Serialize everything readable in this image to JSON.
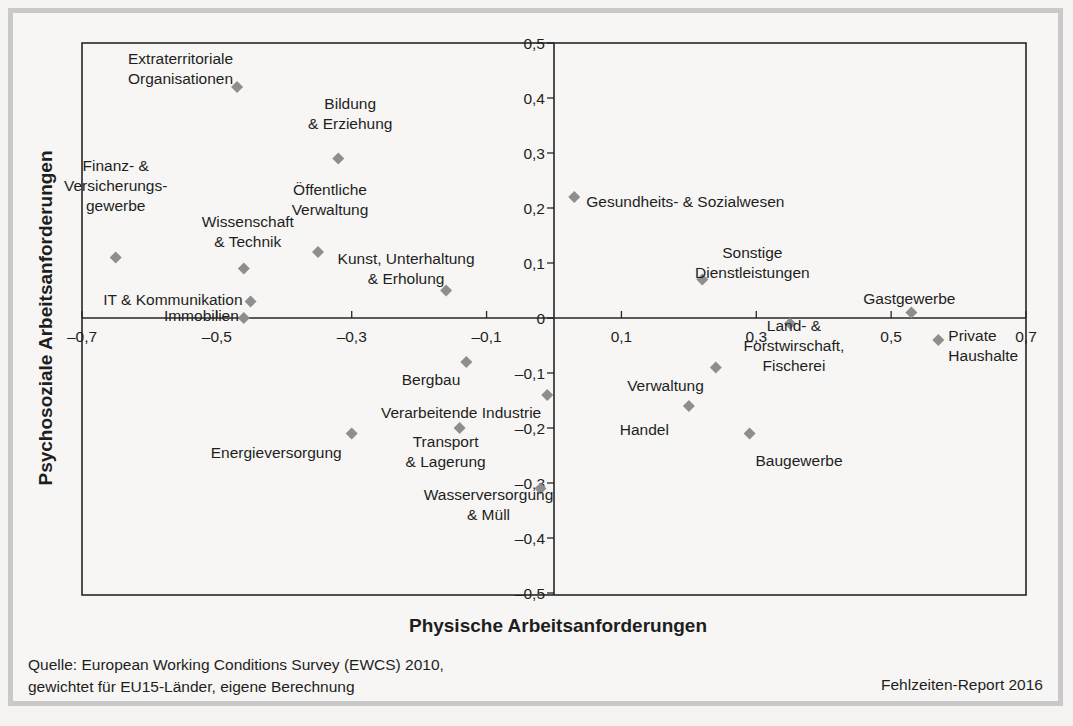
{
  "chart_data": {
    "type": "scatter",
    "title": "",
    "xlabel": "Physische Arbeitsanforderungen",
    "ylabel": "Psychosoziale Arbeitsanforderungen",
    "xlim": [
      -0.7,
      0.7
    ],
    "ylim": [
      -0.5,
      0.5
    ],
    "grid": false,
    "legend": "none",
    "marker": "diamond",
    "marker_color": "#8e8e8e",
    "x_ticks": [
      -0.7,
      -0.5,
      -0.3,
      -0.1,
      0.1,
      0.3,
      0.5,
      0.7
    ],
    "x_tick_labels": [
      "–0,7",
      "–0,5",
      "–0,3",
      "–0,1",
      "0,1",
      "0,3",
      "0,5",
      "0,7"
    ],
    "y_ticks": [
      0.5,
      0.4,
      0.3,
      0.2,
      0.1,
      0,
      -0.1,
      -0.2,
      -0.3,
      -0.4,
      -0.5
    ],
    "y_tick_labels": [
      "0,5",
      "0,4",
      "0,3",
      "0,2",
      "0,1",
      "0",
      "–0,1",
      "–0,2",
      "–0,3",
      "–0,4",
      "–0,5"
    ],
    "points": [
      {
        "label": [
          "Extraterritoriale",
          "Organisationen"
        ],
        "x": -0.47,
        "y": 0.42
      },
      {
        "label": [
          "Bildung",
          "& Erziehung"
        ],
        "x": -0.32,
        "y": 0.29
      },
      {
        "label": [
          "Gesundheits- & Sozialwesen"
        ],
        "x": 0.03,
        "y": 0.22
      },
      {
        "label": [
          "Finanz- &",
          "Versicherungs-",
          "gewerbe"
        ],
        "x": -0.65,
        "y": 0.11
      },
      {
        "label": [
          "Öffentliche",
          "Verwaltung"
        ],
        "x": -0.35,
        "y": 0.12
      },
      {
        "label": [
          "Wissenschaft",
          "& Technik"
        ],
        "x": -0.46,
        "y": 0.09
      },
      {
        "label": [
          "Kunst, Unterhaltung",
          "& Erholung"
        ],
        "x": -0.16,
        "y": 0.05
      },
      {
        "label": [
          "IT & Kommunikation"
        ],
        "x": -0.45,
        "y": 0.03
      },
      {
        "label": [
          "Immobilien"
        ],
        "x": -0.46,
        "y": 0.0
      },
      {
        "label": [
          "Sonstige",
          "Dienstleistungen"
        ],
        "x": 0.22,
        "y": 0.07
      },
      {
        "label": [
          "Gastgewerbe"
        ],
        "x": 0.53,
        "y": 0.01
      },
      {
        "label": [
          "Land- &",
          "Forstwirschaft,",
          "Fischerei"
        ],
        "x": 0.35,
        "y": -0.01
      },
      {
        "label": [
          "Private",
          "Haushalte"
        ],
        "x": 0.57,
        "y": -0.04
      },
      {
        "label": [
          "Bergbau"
        ],
        "x": -0.13,
        "y": -0.08
      },
      {
        "label": [
          "Verwaltung"
        ],
        "x": 0.24,
        "y": -0.09
      },
      {
        "label": [
          "Verarbeitende Industrie"
        ],
        "x": -0.01,
        "y": -0.14
      },
      {
        "label": [
          "Handel"
        ],
        "x": 0.2,
        "y": -0.16
      },
      {
        "label": [
          "Transport",
          "& Lagerung"
        ],
        "x": -0.14,
        "y": -0.2
      },
      {
        "label": [
          "Energieversorgung"
        ],
        "x": -0.3,
        "y": -0.21
      },
      {
        "label": [
          "Baugewerbe"
        ],
        "x": 0.29,
        "y": -0.21
      },
      {
        "label": [
          "Wasserversorgung",
          "& Müll"
        ],
        "x": -0.02,
        "y": -0.31
      }
    ]
  },
  "footer": {
    "source_line1": "Quelle: European Working Conditions Survey (EWCS) 2010,",
    "source_line2": "gewichtet für EU15-Länder, eigene Berechnung",
    "report": "Fehlzeiten-Report 2016"
  }
}
